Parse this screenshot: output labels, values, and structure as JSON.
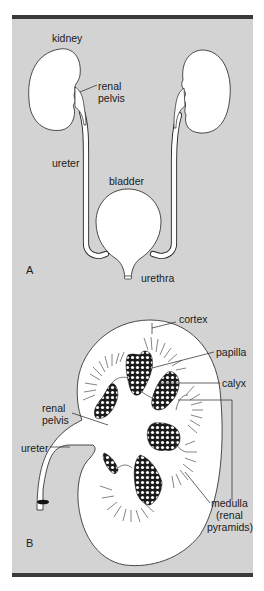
{
  "figure": {
    "panel_a": {
      "letter": "A",
      "labels": {
        "kidney": "kidney",
        "renal_pelvis_line1": "renal",
        "renal_pelvis_line2": "pelvis",
        "ureter": "ureter",
        "bladder": "bladder",
        "urethra": "urethra"
      }
    },
    "panel_b": {
      "letter": "B",
      "labels": {
        "cortex": "cortex",
        "papilla": "papilla",
        "calyx": "calyx",
        "renal_pelvis_line1": "renal",
        "renal_pelvis_line2": "pelvis",
        "ureter": "ureter",
        "medulla_line1": "medulla",
        "medulla_line2": "(renal",
        "medulla_line3": "pyramids)"
      }
    },
    "colors": {
      "background": "#d3d3d3",
      "border_bar": "#3a3a3a",
      "organ_fill": "#ffffff",
      "outline": "#222222"
    }
  }
}
